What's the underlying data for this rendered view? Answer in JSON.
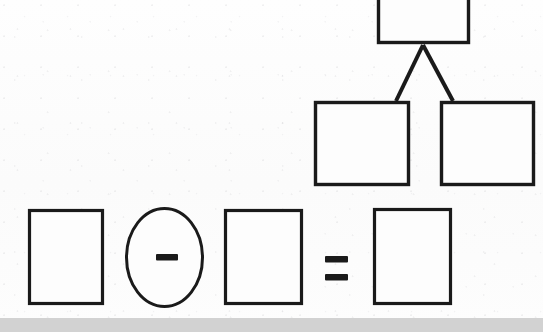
{
  "page": {
    "width": 543,
    "height": 332,
    "background_color": "#fdfdfd",
    "ink_color": "#1a1a1a",
    "band_color": "#d2d2d2"
  },
  "diagram": {
    "type": "scanned-line-drawing",
    "stroke_width": 3,
    "tree": {
      "name": "three-node-tree",
      "root": {
        "label": "",
        "x": 377,
        "y": -16,
        "width": 93,
        "height": 60,
        "clipped_at_top": true
      },
      "children": [
        {
          "label": "",
          "x": 314,
          "y": 101,
          "width": 96,
          "height": 85
        },
        {
          "label": "",
          "x": 440,
          "y": 101,
          "width": 95,
          "height": 85
        }
      ],
      "connectors": [
        {
          "from_x": 423,
          "from_y": 45,
          "to_x": 396,
          "to_y": 101
        },
        {
          "from_x": 423,
          "from_y": 45,
          "to_x": 453,
          "to_y": 101
        }
      ]
    },
    "equation": {
      "name": "subtraction-equation",
      "expression": "[ ] - [ ] = [ ]",
      "terms": [
        {
          "kind": "box",
          "label": "",
          "x": 28,
          "y": 209,
          "width": 76,
          "height": 96
        },
        {
          "kind": "operator",
          "label": "-",
          "symbol": "minus-sign",
          "x": 125,
          "y": 207,
          "width": 79,
          "height": 101,
          "circled": true
        },
        {
          "kind": "box",
          "label": "",
          "x": 224,
          "y": 209,
          "width": 79,
          "height": 96
        },
        {
          "kind": "operator",
          "label": "=",
          "symbol": "equals-sign",
          "x": 325,
          "y": 256,
          "width": 23,
          "height": 24,
          "circled": false
        },
        {
          "kind": "box",
          "label": "",
          "x": 373,
          "y": 208,
          "width": 79,
          "height": 97
        }
      ]
    }
  }
}
